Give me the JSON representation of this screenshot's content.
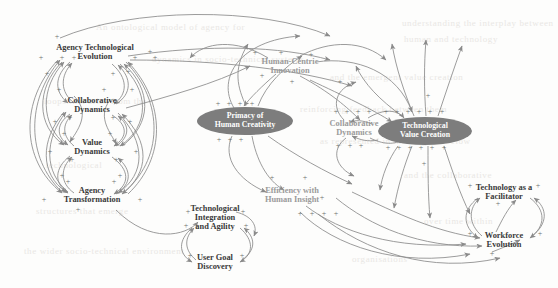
{
  "diagram": {
    "type": "causal-loop-diagram",
    "canvas": {
      "width": 558,
      "height": 288
    },
    "colors": {
      "edge": "#8a8a8a",
      "node_dark_text": "#3a3a3a",
      "node_grey_text": "#9b9b9b",
      "ellipse_fill": "#7d7d7d",
      "ellipse_text": "#ffffff",
      "sign_label": "#6f6f6f",
      "background": "#fdfdfc",
      "watermark": "#e9e7e4"
    },
    "polarity_symbol": "+",
    "nodes": [
      {
        "id": "agency-technological-evolution",
        "label": "Agency Technological\nEvolution",
        "style": "text-dark",
        "x": 95,
        "y": 52
      },
      {
        "id": "collaborative-dynamics-left",
        "label": "Collaborative\nDynamics",
        "style": "text-dark",
        "x": 92,
        "y": 105
      },
      {
        "id": "value-dynamics",
        "label": "Value\nDynamics",
        "style": "text-dark",
        "x": 92,
        "y": 147
      },
      {
        "id": "agency-transformation",
        "label": "Agency\nTransformation",
        "style": "text-dark",
        "x": 92,
        "y": 195
      },
      {
        "id": "human-centric-innovation",
        "label": "Human-Centric\nInnovation",
        "style": "text-grey",
        "x": 290,
        "y": 66
      },
      {
        "id": "primacy-of-human-creativity",
        "label": "Primacy of\nHuman Creativity",
        "style": "ellipse",
        "x": 245,
        "y": 121,
        "w": 96,
        "h": 28
      },
      {
        "id": "collaborative-dynamics-right",
        "label": "Collaborative\nDynamics",
        "style": "text-grey",
        "x": 354,
        "y": 128
      },
      {
        "id": "technological-value-creation",
        "label": "Technological\nValue Creation",
        "style": "ellipse",
        "x": 425,
        "y": 131,
        "w": 94,
        "h": 28
      },
      {
        "id": "efficiency-with-human-insight",
        "label": "Efficiency with\nHuman Insight",
        "style": "text-grey",
        "x": 292,
        "y": 195
      },
      {
        "id": "technology-as-a-facilitator",
        "label": "Technology as a\nFacilitator",
        "style": "text-dark",
        "x": 504,
        "y": 192
      },
      {
        "id": "workforce-evolution",
        "label": "Workforce\nEvolution",
        "style": "text-dark",
        "x": 504,
        "y": 240
      },
      {
        "id": "technological-integration-and-agility",
        "label": "Technological\nIntegration\nand Agility",
        "style": "text-dark",
        "x": 215,
        "y": 218
      },
      {
        "id": "user-goal-discovery",
        "label": "User Goal\nDiscovery",
        "style": "text-dark",
        "x": 215,
        "y": 262
      }
    ],
    "edge_count": 58,
    "sign_label_count": 92
  }
}
